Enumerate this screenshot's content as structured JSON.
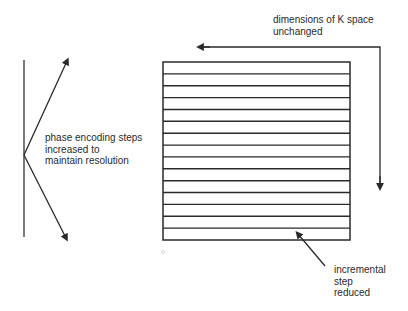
{
  "diagram": {
    "kspace_label": {
      "line1": "dimensions of K space",
      "line2": "unchanged"
    },
    "phase_label": {
      "line1": "phase encoding steps",
      "line2": "increased to",
      "line3": "maintain resolution"
    },
    "step_label": {
      "line1": "incremental",
      "line2": "step",
      "line3": "reduced"
    },
    "grid": {
      "stripe_count": 15,
      "line_color": "#2a2a2a"
    }
  }
}
